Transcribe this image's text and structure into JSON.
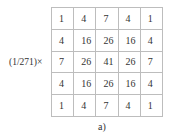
{
  "figure": {
    "prefix": "(1/271)×",
    "caption": "a)",
    "matrix": [
      [
        "1",
        "4",
        "7",
        "4",
        "1"
      ],
      [
        "4",
        "16",
        "26",
        "16",
        "4"
      ],
      [
        "7",
        "26",
        "41",
        "26",
        "7"
      ],
      [
        "4",
        "16",
        "26",
        "16",
        "4"
      ],
      [
        "1",
        "4",
        "7",
        "4",
        "1"
      ]
    ]
  }
}
